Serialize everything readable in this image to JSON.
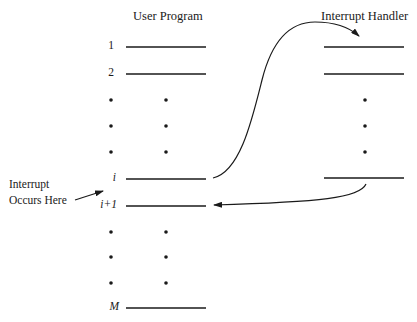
{
  "diagram": {
    "user_program": {
      "title": "User Program",
      "rows": [
        {
          "label": "1",
          "italic": false
        },
        {
          "label": "2",
          "italic": false
        },
        {
          "label": "i",
          "italic": true
        },
        {
          "label": "i+1",
          "italic": true
        },
        {
          "label": "M",
          "italic": true
        }
      ]
    },
    "interrupt_handler": {
      "title": "Interrupt Handler"
    },
    "annotation": {
      "line1": "Interrupt",
      "line2": "Occurs Here"
    },
    "arrows": [
      {
        "from": "user-program-line-i",
        "to": "interrupt-handler-line-1",
        "meaning": "transfer to interrupt handler"
      },
      {
        "from": "interrupt-handler-last-line",
        "to": "user-program-line-i+1",
        "meaning": "return to user program"
      }
    ],
    "colors": {
      "stroke": "#1a1a1a",
      "background": "#ffffff"
    }
  }
}
